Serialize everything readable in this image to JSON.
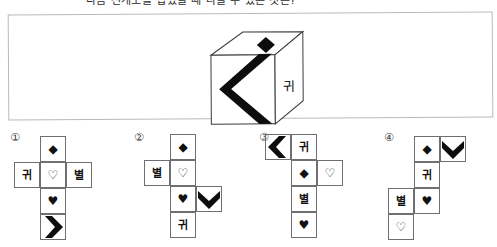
{
  "question": {
    "text": "다음 전개도를 접었을 때 나올 수 있는 것은?"
  },
  "stimulus": {
    "name": "cube-3d",
    "faces": {
      "top": {
        "symbol": "◆",
        "symbol_name": "solid-diamond"
      },
      "front": {
        "symbol": "chevron-left",
        "symbol_name": "chevron-left-thick"
      },
      "right": {
        "symbol": "귀",
        "symbol_name": "hangul-gwi"
      }
    }
  },
  "glyphs": {
    "solid_diamond": "◆",
    "open_heart": "♡",
    "solid_heart": "♥",
    "gwi": "귀",
    "byeol": "별"
  },
  "options": [
    {
      "number": "①",
      "name": "option-1",
      "cells": [
        {
          "name": "cell-diamond",
          "text": "◆",
          "kind": "sym",
          "x": 38,
          "y": 10
        },
        {
          "name": "cell-gwi",
          "text": "귀",
          "kind": "han",
          "x": 12,
          "y": 36
        },
        {
          "name": "cell-open-heart",
          "text": "♡",
          "kind": "sym",
          "x": 38,
          "y": 36
        },
        {
          "name": "cell-byeol",
          "text": "별",
          "kind": "han",
          "x": 64,
          "y": 36
        },
        {
          "name": "cell-solid-heart",
          "text": "♥",
          "kind": "sym",
          "x": 38,
          "y": 62
        },
        {
          "name": "cell-chevron",
          "text": "",
          "kind": "chevron-right",
          "x": 38,
          "y": 88
        }
      ]
    },
    {
      "number": "②",
      "name": "option-2",
      "cells": [
        {
          "name": "cell-diamond",
          "text": "◆",
          "kind": "sym",
          "x": 44,
          "y": 8
        },
        {
          "name": "cell-byeol",
          "text": "별",
          "kind": "han",
          "x": 18,
          "y": 34
        },
        {
          "name": "cell-open-heart",
          "text": "♡",
          "kind": "sym",
          "x": 44,
          "y": 34
        },
        {
          "name": "cell-solid-heart",
          "text": "♥",
          "kind": "sym",
          "x": 44,
          "y": 60
        },
        {
          "name": "cell-chevron",
          "text": "",
          "kind": "chevron-down",
          "x": 70,
          "y": 60
        },
        {
          "name": "cell-gwi",
          "text": "귀",
          "kind": "han",
          "x": 44,
          "y": 86
        }
      ]
    },
    {
      "number": "③",
      "name": "option-3",
      "cells": [
        {
          "name": "cell-chevron",
          "text": "",
          "kind": "chevron-left",
          "x": 14,
          "y": 8
        },
        {
          "name": "cell-gwi",
          "text": "귀",
          "kind": "han",
          "x": 40,
          "y": 8
        },
        {
          "name": "cell-diamond",
          "text": "◆",
          "kind": "sym",
          "x": 40,
          "y": 34
        },
        {
          "name": "cell-open-heart",
          "text": "♡",
          "kind": "sym",
          "x": 66,
          "y": 34
        },
        {
          "name": "cell-byeol",
          "text": "별",
          "kind": "han",
          "x": 40,
          "y": 60
        },
        {
          "name": "cell-solid-heart",
          "text": "♥",
          "kind": "sym",
          "x": 40,
          "y": 86
        }
      ]
    },
    {
      "number": "④",
      "name": "option-4",
      "cells": [
        {
          "name": "cell-diamond",
          "text": "◆",
          "kind": "sym",
          "x": 38,
          "y": 10
        },
        {
          "name": "cell-chevron",
          "text": "",
          "kind": "chevron-down",
          "x": 64,
          "y": 10
        },
        {
          "name": "cell-gwi",
          "text": "귀",
          "kind": "han",
          "x": 38,
          "y": 36
        },
        {
          "name": "cell-byeol",
          "text": "별",
          "kind": "han",
          "x": 12,
          "y": 62
        },
        {
          "name": "cell-solid-heart",
          "text": "♥",
          "kind": "sym",
          "x": 38,
          "y": 62
        },
        {
          "name": "cell-open-heart",
          "text": "♡",
          "kind": "sym",
          "x": 12,
          "y": 88
        }
      ]
    }
  ],
  "colors": {
    "ink": "#111111",
    "cell_border": "#6e6e73",
    "panel_border": "#b9b9bd",
    "background": "#ffffff"
  }
}
